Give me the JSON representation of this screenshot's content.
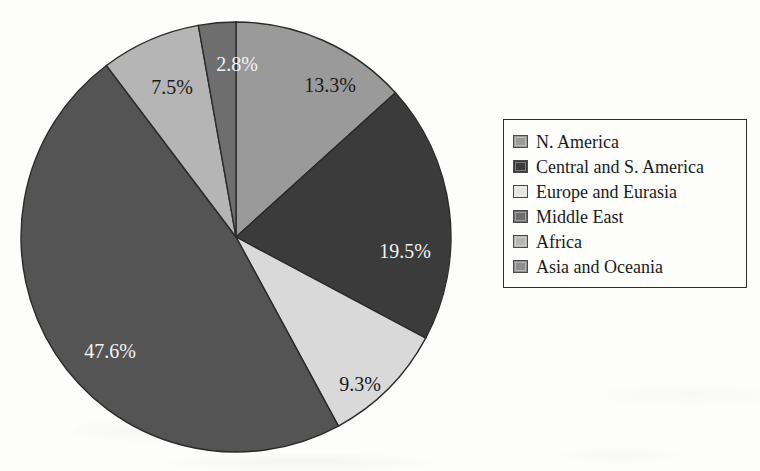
{
  "chart_data": {
    "type": "pie",
    "title": "",
    "subtitle": "",
    "xlabel": "",
    "ylabel": "",
    "legend_position": "right",
    "grid": false,
    "start_angle_deg": 0,
    "direction": "clockwise",
    "units": "percent",
    "categories": [
      "N. America",
      "Central and S. America",
      "Europe and Eurasia",
      "Middle East",
      "Africa",
      "Asia and Oceania"
    ],
    "values": [
      13.3,
      19.5,
      9.3,
      2.8,
      7.5,
      47.6
    ],
    "labels": [
      "13.3%",
      "19.5%",
      "9.3%",
      "2.8%",
      "7.5%",
      "47.6%"
    ],
    "colors": [
      "#9a9a9a",
      "#3b3b3b",
      "#d9d9d9",
      "#6e6e6e",
      "#b5b5b5",
      "#545454"
    ],
    "slice_draw_order": [
      {
        "name": "N. America",
        "value": 13.3,
        "label": "13.3%",
        "color": "#9a9a9a",
        "label_color": "#1b1b1b",
        "label_x": 310,
        "label_y": 66
      },
      {
        "name": "Central and S. America",
        "value": 19.5,
        "label": "19.5%",
        "color": "#3b3b3b",
        "label_color": "#f2f2f2",
        "label_x": 385,
        "label_y": 232
      },
      {
        "name": "Europe and Eurasia",
        "value": 9.3,
        "label": "9.3%",
        "color": "#d9d9d9",
        "label_color": "#1b1b1b",
        "label_x": 340,
        "label_y": 365
      },
      {
        "name": "Asia and Oceania",
        "value": 47.6,
        "label": "47.6%",
        "color": "#545454",
        "label_color": "#f2f2f2",
        "label_x": 90,
        "label_y": 332
      },
      {
        "name": "Africa",
        "value": 7.5,
        "label": "7.5%",
        "color": "#b5b5b5",
        "label_color": "#1b1b1b",
        "label_x": 152,
        "label_y": 68
      },
      {
        "name": "Middle East",
        "value": 2.8,
        "label": "2.8%",
        "color": "#6e6e6e",
        "label_color": "#f2f2f2",
        "label_x": 217,
        "label_y": 45
      }
    ]
  },
  "pie": {
    "center_x": 216,
    "center_y": 216,
    "radius": 215,
    "outline_color": "#2b2b2b"
  },
  "legend": {
    "border_color": "#2e2e2e",
    "items": [
      {
        "label": "N. America",
        "color": "#9a9a9a"
      },
      {
        "label": "Central and S. America",
        "color": "#3b3b3b"
      },
      {
        "label": "Europe and Eurasia",
        "color": "#e4e4e4"
      },
      {
        "label": "Middle East",
        "color": "#6e6e6e"
      },
      {
        "label": "Africa",
        "color": "#b5b5b5"
      },
      {
        "label": "Asia and Oceania",
        "color": "#8e8e8e"
      }
    ]
  }
}
